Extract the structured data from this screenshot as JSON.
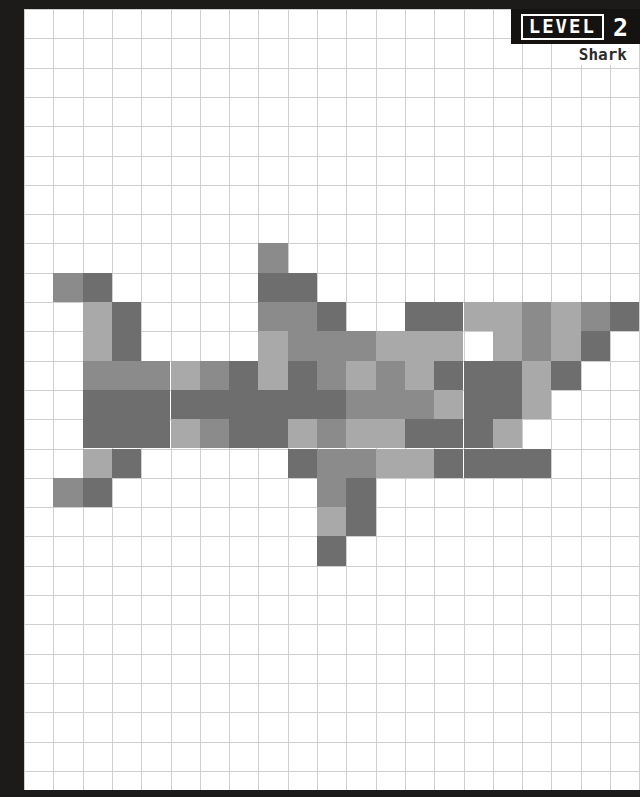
{
  "header": {
    "level_word": "LEVEL",
    "level_number": "2",
    "subject_label": "Shark"
  },
  "palette": {
    "paper": "#ffffff",
    "border": "#1c1b1a",
    "gridline": "#cfcfcf",
    "light": "#a9a9a9",
    "medium": "#8b8b8b",
    "dark": "#6e6e6e",
    "badge_bg": "#141312",
    "badge_text": "#ffffff",
    "label_text": "#2b2b2b"
  },
  "grid": {
    "cols": 21,
    "rows": 27,
    "cell_size": 29.3,
    "origin_x": 0,
    "origin_y": 0,
    "show_gridlines": true
  },
  "chart_data": {
    "type": "heatmap",
    "title": "Shark",
    "subtitle": "LEVEL 2",
    "xlabel": "",
    "ylabel": "",
    "legend": [
      "light",
      "medium",
      "dark"
    ],
    "color_codes": {
      "0": "#ffffff",
      "1": "#a9a9a9",
      "2": "#8b8b8b",
      "3": "#6e6e6e"
    },
    "note": "Pixel-art shark sprite drawn on a 21x27 grid; 0 = empty paper cell.",
    "cells": [
      {
        "r": 8,
        "c": 8,
        "v": 2
      },
      {
        "r": 9,
        "c": 1,
        "v": 2
      },
      {
        "r": 9,
        "c": 2,
        "v": 3
      },
      {
        "r": 9,
        "c": 8,
        "v": 3
      },
      {
        "r": 9,
        "c": 9,
        "v": 3
      },
      {
        "r": 10,
        "c": 2,
        "v": 1
      },
      {
        "r": 10,
        "c": 3,
        "v": 3
      },
      {
        "r": 10,
        "c": 8,
        "v": 2
      },
      {
        "r": 10,
        "c": 9,
        "v": 2
      },
      {
        "r": 10,
        "c": 10,
        "v": 3
      },
      {
        "r": 10,
        "c": 13,
        "v": 3
      },
      {
        "r": 10,
        "c": 14,
        "v": 3
      },
      {
        "r": 10,
        "c": 15,
        "v": 1
      },
      {
        "r": 10,
        "c": 16,
        "v": 1
      },
      {
        "r": 10,
        "c": 17,
        "v": 2
      },
      {
        "r": 10,
        "c": 18,
        "v": 1
      },
      {
        "r": 10,
        "c": 19,
        "v": 2
      },
      {
        "r": 10,
        "c": 20,
        "v": 3
      },
      {
        "r": 11,
        "c": 2,
        "v": 1
      },
      {
        "r": 11,
        "c": 3,
        "v": 3
      },
      {
        "r": 11,
        "c": 8,
        "v": 1
      },
      {
        "r": 11,
        "c": 9,
        "v": 2
      },
      {
        "r": 11,
        "c": 10,
        "v": 2
      },
      {
        "r": 11,
        "c": 11,
        "v": 2
      },
      {
        "r": 11,
        "c": 12,
        "v": 1
      },
      {
        "r": 11,
        "c": 13,
        "v": 1
      },
      {
        "r": 11,
        "c": 14,
        "v": 1
      },
      {
        "r": 11,
        "c": 16,
        "v": 1
      },
      {
        "r": 11,
        "c": 17,
        "v": 2
      },
      {
        "r": 11,
        "c": 18,
        "v": 1
      },
      {
        "r": 11,
        "c": 19,
        "v": 3
      },
      {
        "r": 12,
        "c": 2,
        "v": 2
      },
      {
        "r": 12,
        "c": 3,
        "v": 2
      },
      {
        "r": 12,
        "c": 4,
        "v": 2
      },
      {
        "r": 12,
        "c": 5,
        "v": 1
      },
      {
        "r": 12,
        "c": 6,
        "v": 2
      },
      {
        "r": 12,
        "c": 7,
        "v": 3
      },
      {
        "r": 12,
        "c": 8,
        "v": 1
      },
      {
        "r": 12,
        "c": 9,
        "v": 3
      },
      {
        "r": 12,
        "c": 10,
        "v": 2
      },
      {
        "r": 12,
        "c": 11,
        "v": 1
      },
      {
        "r": 12,
        "c": 12,
        "v": 2
      },
      {
        "r": 12,
        "c": 13,
        "v": 1
      },
      {
        "r": 12,
        "c": 14,
        "v": 3
      },
      {
        "r": 12,
        "c": 15,
        "v": 3
      },
      {
        "r": 12,
        "c": 16,
        "v": 3
      },
      {
        "r": 12,
        "c": 17,
        "v": 1
      },
      {
        "r": 12,
        "c": 18,
        "v": 3
      },
      {
        "r": 13,
        "c": 2,
        "v": 3
      },
      {
        "r": 13,
        "c": 3,
        "v": 3
      },
      {
        "r": 13,
        "c": 4,
        "v": 3
      },
      {
        "r": 13,
        "c": 5,
        "v": 3
      },
      {
        "r": 13,
        "c": 6,
        "v": 3
      },
      {
        "r": 13,
        "c": 7,
        "v": 3
      },
      {
        "r": 13,
        "c": 8,
        "v": 3
      },
      {
        "r": 13,
        "c": 9,
        "v": 3
      },
      {
        "r": 13,
        "c": 10,
        "v": 3
      },
      {
        "r": 13,
        "c": 11,
        "v": 2
      },
      {
        "r": 13,
        "c": 12,
        "v": 2
      },
      {
        "r": 13,
        "c": 13,
        "v": 2
      },
      {
        "r": 13,
        "c": 14,
        "v": 1
      },
      {
        "r": 13,
        "c": 15,
        "v": 3
      },
      {
        "r": 13,
        "c": 16,
        "v": 3
      },
      {
        "r": 13,
        "c": 17,
        "v": 1
      },
      {
        "r": 14,
        "c": 2,
        "v": 3
      },
      {
        "r": 14,
        "c": 3,
        "v": 3
      },
      {
        "r": 14,
        "c": 4,
        "v": 3
      },
      {
        "r": 14,
        "c": 5,
        "v": 1
      },
      {
        "r": 14,
        "c": 6,
        "v": 2
      },
      {
        "r": 14,
        "c": 7,
        "v": 3
      },
      {
        "r": 14,
        "c": 8,
        "v": 3
      },
      {
        "r": 14,
        "c": 9,
        "v": 1
      },
      {
        "r": 14,
        "c": 10,
        "v": 2
      },
      {
        "r": 14,
        "c": 11,
        "v": 1
      },
      {
        "r": 14,
        "c": 12,
        "v": 1
      },
      {
        "r": 14,
        "c": 13,
        "v": 3
      },
      {
        "r": 14,
        "c": 14,
        "v": 3
      },
      {
        "r": 14,
        "c": 15,
        "v": 3
      },
      {
        "r": 14,
        "c": 16,
        "v": 1
      },
      {
        "r": 15,
        "c": 2,
        "v": 1
      },
      {
        "r": 15,
        "c": 3,
        "v": 3
      },
      {
        "r": 15,
        "c": 9,
        "v": 3
      },
      {
        "r": 15,
        "c": 10,
        "v": 2
      },
      {
        "r": 15,
        "c": 11,
        "v": 2
      },
      {
        "r": 15,
        "c": 12,
        "v": 1
      },
      {
        "r": 15,
        "c": 13,
        "v": 1
      },
      {
        "r": 15,
        "c": 14,
        "v": 3
      },
      {
        "r": 15,
        "c": 15,
        "v": 3
      },
      {
        "r": 15,
        "c": 16,
        "v": 3
      },
      {
        "r": 15,
        "c": 17,
        "v": 3
      },
      {
        "r": 16,
        "c": 1,
        "v": 2
      },
      {
        "r": 16,
        "c": 2,
        "v": 3
      },
      {
        "r": 16,
        "c": 10,
        "v": 2
      },
      {
        "r": 16,
        "c": 11,
        "v": 3
      },
      {
        "r": 17,
        "c": 10,
        "v": 1
      },
      {
        "r": 17,
        "c": 11,
        "v": 3
      },
      {
        "r": 18,
        "c": 10,
        "v": 3
      }
    ]
  }
}
